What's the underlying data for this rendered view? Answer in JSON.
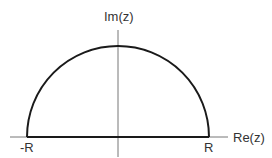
{
  "diagram": {
    "axes": {
      "x_label": "Re(z)",
      "y_label": "Im(z)"
    },
    "points": {
      "left_label": "-R",
      "right_label": "R"
    },
    "contour": {
      "shape": "semicircle",
      "radius_symbol": "R",
      "segments": [
        "line segment from -R to R on real axis",
        "semicircular arc of radius R in upper half plane"
      ]
    },
    "colors": {
      "axis": "#777777",
      "contour": "#1a1a1a",
      "text": "#333333",
      "background": "#ffffff"
    }
  }
}
